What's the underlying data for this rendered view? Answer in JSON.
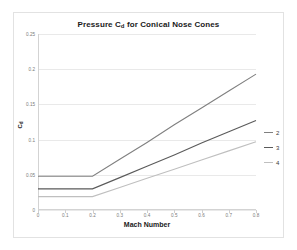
{
  "chart_data": {
    "type": "line",
    "title": "Pressure Cd for Conical Nose Cones",
    "title_main": "Pressure C",
    "title_sub": "d",
    "title_rest": " for Conical Nose Cones",
    "xlabel": "Mach Number",
    "ylabel": "Cd",
    "ylabel_main": "C",
    "ylabel_sub": "d",
    "xlim": [
      0,
      0.8
    ],
    "ylim": [
      0,
      0.25
    ],
    "xticks": [
      "0",
      "0.1",
      "0.2",
      "0.3",
      "0.4",
      "0.5",
      "0.6",
      "0.7",
      "0.8"
    ],
    "xtick_values": [
      0,
      0.1,
      0.2,
      0.3,
      0.4,
      0.5,
      0.6,
      0.7,
      0.8
    ],
    "yticks": [
      "0",
      "0.05",
      "0.1",
      "0.15",
      "0.2",
      "0.25"
    ],
    "ytick_values": [
      0,
      0.05,
      0.1,
      0.15,
      0.2,
      0.25
    ],
    "grid": true,
    "legend_position": "right",
    "x": [
      0,
      0.1,
      0.2,
      0.3,
      0.4,
      0.5,
      0.6,
      0.7,
      0.8
    ],
    "series": [
      {
        "name": "2",
        "color": "#808080",
        "values": [
          0.048,
          0.048,
          0.048,
          0.072,
          0.096,
          0.121,
          0.145,
          0.169,
          0.193
        ]
      },
      {
        "name": "3",
        "color": "#5a5a5a",
        "values": [
          0.03,
          0.03,
          0.03,
          0.046,
          0.062,
          0.078,
          0.095,
          0.111,
          0.127
        ]
      },
      {
        "name": "4",
        "color": "#bfbfbf",
        "values": [
          0.019,
          0.019,
          0.019,
          0.032,
          0.045,
          0.058,
          0.071,
          0.084,
          0.097
        ]
      }
    ]
  },
  "legend": {
    "items": [
      {
        "label": "2",
        "color": "#808080"
      },
      {
        "label": "3",
        "color": "#5a5a5a"
      },
      {
        "label": "4",
        "color": "#bfbfbf"
      }
    ]
  }
}
